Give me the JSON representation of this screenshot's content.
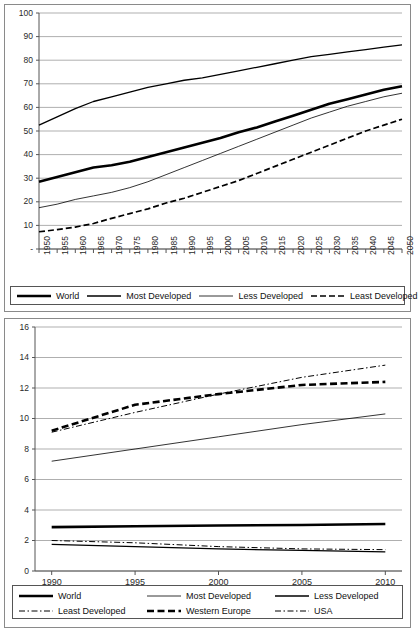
{
  "charts": [
    {
      "id": "top",
      "chart_data": {
        "type": "line",
        "title": "",
        "xlabel": "",
        "ylabel": "",
        "xlim": [
          1950,
          2050
        ],
        "ylim": [
          0,
          100
        ],
        "grid": true,
        "legend_position": "below",
        "ytick_labels": [
          "-",
          "10",
          "20",
          "30",
          "40",
          "50",
          "60",
          "70",
          "80",
          "90",
          "100"
        ],
        "ytick_values": [
          0,
          10,
          20,
          30,
          40,
          50,
          60,
          70,
          80,
          90,
          100
        ],
        "xtick_labels": [
          "1950",
          "1955",
          "1960",
          "1965",
          "1970",
          "1975",
          "1980",
          "1985",
          "1990",
          "1995",
          "2000",
          "2005",
          "2010",
          "2015",
          "2020",
          "2025",
          "2030",
          "2035",
          "2040",
          "2045",
          "2050"
        ],
        "x": [
          1950,
          1955,
          1960,
          1965,
          1970,
          1975,
          1980,
          1985,
          1990,
          1995,
          2000,
          2005,
          2010,
          2015,
          2020,
          2025,
          2030,
          2035,
          2040,
          2045,
          2050
        ],
        "series": [
          {
            "name": "World",
            "style": "thick-solid",
            "values": [
              28.5,
              30.5,
              32.5,
              34.5,
              35.5,
              37.0,
              39.0,
              41.0,
              43.0,
              45.0,
              47.0,
              49.5,
              51.5,
              54.0,
              56.5,
              59.0,
              61.5,
              63.5,
              65.5,
              67.5,
              69.0
            ]
          },
          {
            "name": "Most Developed",
            "style": "medium-solid",
            "values": [
              52.5,
              56.0,
              59.5,
              62.5,
              64.5,
              66.5,
              68.5,
              70.0,
              71.5,
              72.5,
              74.0,
              75.5,
              77.0,
              78.5,
              80.0,
              81.5,
              82.5,
              83.5,
              84.5,
              85.5,
              86.5
            ]
          },
          {
            "name": "Less Developed",
            "style": "thin-solid",
            "values": [
              17.5,
              19.0,
              21.0,
              22.5,
              24.0,
              26.0,
              28.5,
              31.5,
              34.5,
              37.5,
              40.5,
              43.5,
              46.5,
              49.5,
              52.5,
              55.5,
              58.0,
              60.5,
              62.5,
              64.5,
              66.0
            ]
          },
          {
            "name": "Least Developed",
            "style": "dashed",
            "values": [
              7.3,
              8.2,
              9.3,
              10.8,
              13.0,
              15.0,
              17.0,
              19.5,
              21.5,
              24.0,
              26.5,
              29.0,
              32.0,
              35.0,
              38.0,
              41.0,
              44.0,
              47.0,
              50.0,
              52.5,
              55.0
            ]
          }
        ]
      },
      "legend": [
        {
          "label": "World",
          "style": "thick-solid"
        },
        {
          "label": "Most Developed",
          "style": "medium-solid"
        },
        {
          "label": "Less Developed",
          "style": "thin-solid"
        },
        {
          "label": "Least Developed",
          "style": "dashed"
        }
      ]
    },
    {
      "id": "bottom",
      "chart_data": {
        "type": "line",
        "title": "",
        "xlabel": "",
        "ylabel": "",
        "xlim": [
          1989,
          2011
        ],
        "ylim": [
          0,
          16
        ],
        "grid": true,
        "legend_position": "below",
        "ytick_labels": [
          "0",
          "2",
          "4",
          "6",
          "8",
          "10",
          "12",
          "14",
          "16"
        ],
        "ytick_values": [
          0,
          2,
          4,
          6,
          8,
          10,
          12,
          14,
          16
        ],
        "xtick_labels": [
          "1990",
          "1995",
          "2000",
          "2005",
          "2010"
        ],
        "x": [
          1990,
          1995,
          2000,
          2005,
          2010
        ],
        "series": [
          {
            "name": "World",
            "style": "thick-solid",
            "values": [
              2.88,
              2.93,
              2.98,
              3.02,
              3.08
            ]
          },
          {
            "name": "Most Developed",
            "style": "thin-solid",
            "values": [
              7.2,
              8.0,
              8.8,
              9.6,
              10.3
            ]
          },
          {
            "name": "Less Developed",
            "style": "medium-solid",
            "values": [
              1.75,
              1.6,
              1.45,
              1.35,
              1.25
            ]
          },
          {
            "name": "Least Developed",
            "style": "dash-dot-thin",
            "values": [
              2.0,
              1.85,
              1.6,
              1.45,
              1.4
            ]
          },
          {
            "name": "Western Europe",
            "style": "thick-dashed",
            "values": [
              9.2,
              10.9,
              11.6,
              12.2,
              12.4
            ]
          },
          {
            "name": "USA",
            "style": "dash-dot-thin",
            "values": [
              9.1,
              10.4,
              11.6,
              12.7,
              13.5
            ]
          }
        ]
      },
      "legend": [
        {
          "label": "World",
          "style": "thick-solid"
        },
        {
          "label": "Most Developed",
          "style": "thin-solid"
        },
        {
          "label": "Less Developed",
          "style": "medium-solid"
        },
        {
          "label": "Least Developed",
          "style": "dash-dot-thin"
        },
        {
          "label": "Western Europe",
          "style": "thick-dashed"
        },
        {
          "label": "USA",
          "style": "dash-dot-thin"
        }
      ]
    }
  ],
  "colors": {
    "line": "#000000",
    "grid": "#a6a6a6",
    "axis": "#555555",
    "frame": "#8a8a8a",
    "text": "#1a1a1a"
  }
}
